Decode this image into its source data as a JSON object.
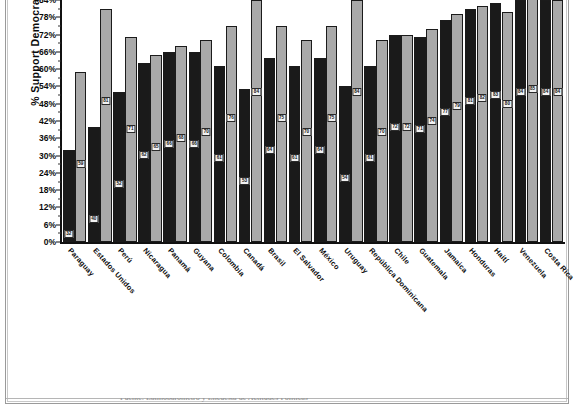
{
  "page": {
    "frame_color": "#9a9a9a",
    "background": "#ffffff",
    "caption_clipped": "Fuente: Latinobarómetro y Encuesta de Actitudes Políticas"
  },
  "chart_data": {
    "type": "bar",
    "title": "",
    "xlabel": "",
    "ylabel": "% Support Democracy",
    "ylim": [
      0,
      84
    ],
    "ytick_labels": [
      "0%",
      "6%",
      "12%",
      "18%",
      "24%",
      "30%",
      "36%",
      "42%",
      "48%",
      "54%",
      "60%",
      "66%",
      "72%",
      "78%",
      "84%"
    ],
    "ytick_values": [
      0,
      6,
      12,
      18,
      24,
      30,
      36,
      42,
      48,
      54,
      60,
      66,
      72,
      78,
      84
    ],
    "grid": false,
    "legend": "none",
    "bar_colors": {
      "series_1": "#1a1a1a",
      "series_2": "#a9a9a9",
      "outline": "#1b1b1b"
    },
    "categories": [
      "Paraguay",
      "Estados Unidos",
      "Perú",
      "Nicaragua",
      "Panamá",
      "Guyana",
      "Colombia",
      "Canadá",
      "Brasil",
      "El Salvador",
      "México",
      "Uruguay",
      "República Dominicana",
      "Chile",
      "Guatemala",
      "Jamaica",
      "Honduras",
      "Haití",
      "Venezuela",
      "Costa Rica"
    ],
    "series": [
      {
        "name": "dark",
        "values": [
          32,
          40,
          52,
          62,
          66,
          66,
          61,
          53,
          64,
          61,
          64,
          54,
          61,
          72,
          71,
          77,
          81,
          83,
          84,
          84
        ]
      },
      {
        "name": "light",
        "values": [
          59,
          81,
          71,
          65,
          68,
          70,
          75,
          84,
          75,
          70,
          75,
          84,
          70,
          72,
          74,
          79,
          82,
          80,
          85,
          84
        ]
      }
    ],
    "point_labels_dark": [
      "32",
      "40",
      "52",
      "62",
      "66",
      "66",
      "61",
      "53",
      "64",
      "61",
      "64",
      "54",
      "61",
      "72",
      "71",
      "77",
      "81",
      "83",
      "84",
      "84"
    ],
    "point_labels_light": [
      "59",
      "81",
      "71",
      "65",
      "68",
      "70",
      "76",
      "84",
      "75",
      "70",
      "75",
      "84",
      "70",
      "72",
      "74",
      "79",
      "82",
      "80",
      "85",
      "84"
    ]
  }
}
